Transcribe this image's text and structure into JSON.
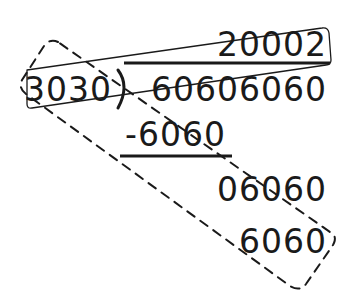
{
  "diagram": {
    "type": "long-division",
    "divisor": "3030",
    "dividend": "60606060",
    "quotient": "20002",
    "steps": [
      {
        "label": "subtract",
        "text": "-6060"
      },
      {
        "label": "remainder-bring-down",
        "text": "06060"
      },
      {
        "label": "subtract",
        "text": "6060"
      }
    ],
    "annotations": [
      {
        "kind": "solid-box",
        "encloses": [
          "3030",
          "2"
        ],
        "note": "links divisor to last quotient digit"
      },
      {
        "kind": "dashed-box",
        "encloses": [
          "3030",
          "-6060",
          "06060",
          "6060"
        ],
        "note": "diagonal grouping of divisor and subtraction steps"
      }
    ],
    "colors": {
      "ink": "#1a1a1a",
      "background": "#ffffff"
    }
  }
}
